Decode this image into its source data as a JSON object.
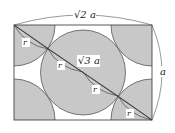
{
  "diagram": {
    "type": "geometry",
    "labels": {
      "top_width": "√2 a",
      "right_height": "a",
      "diagonal": "√3 a",
      "radius": "r"
    },
    "colors": {
      "fill": "#c8c8c8",
      "stroke": "#333333",
      "background": "#ffffff"
    }
  }
}
